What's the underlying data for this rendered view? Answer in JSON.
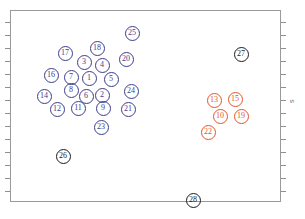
{
  "figure": {
    "axis_label_right": "s",
    "frame": {
      "x": 10,
      "y": 10,
      "width": 271,
      "height": 192
    }
  },
  "chart_data": {
    "type": "scatter",
    "title": "",
    "xlabel": "",
    "ylabel": "s",
    "grid": false,
    "legend": "none",
    "xlim": [
      0,
      271
    ],
    "ylim": [
      0,
      192
    ],
    "axis_ticks": {
      "left_labeled": false,
      "right_labeled": false,
      "bottom_labeled": false,
      "top_labeled": false,
      "left_tick_y": [
        22,
        35,
        48,
        61,
        74,
        87,
        100,
        113,
        126,
        139,
        152,
        165,
        178,
        191
      ],
      "right_tick_y": [
        22,
        35,
        48,
        61,
        74,
        87,
        100,
        113,
        126,
        139,
        152,
        165,
        178,
        191
      ]
    },
    "series": [
      {
        "name": "cluster-blue",
        "color": "#3d3d8c",
        "marker": "numbered-circle",
        "points": [
          {
            "label": "1",
            "x": 79,
            "y": 68
          },
          {
            "label": "2",
            "x": 92,
            "y": 85
          },
          {
            "label": "3",
            "x": 74,
            "y": 52
          },
          {
            "label": "4",
            "x": 92,
            "y": 55
          },
          {
            "label": "5",
            "x": 101,
            "y": 69
          },
          {
            "label": "6",
            "x": 76,
            "y": 86
          },
          {
            "label": "7",
            "x": 61,
            "y": 67
          },
          {
            "label": "8",
            "x": 61,
            "y": 80
          },
          {
            "label": "9",
            "x": 93,
            "y": 98
          },
          {
            "label": "11",
            "x": 68,
            "y": 98
          },
          {
            "label": "12",
            "x": 47,
            "y": 99
          },
          {
            "label": "14",
            "x": 34,
            "y": 86
          },
          {
            "label": "16",
            "x": 41,
            "y": 65
          },
          {
            "label": "17",
            "x": 55,
            "y": 43
          },
          {
            "label": "18",
            "x": 87,
            "y": 38
          },
          {
            "label": "20",
            "x": 116,
            "y": 49
          },
          {
            "label": "21",
            "x": 118,
            "y": 99
          },
          {
            "label": "23",
            "x": 91,
            "y": 117
          },
          {
            "label": "24",
            "x": 121,
            "y": 81
          },
          {
            "label": "25",
            "x": 122,
            "y": 23
          }
        ]
      },
      {
        "name": "cluster-red",
        "color": "#e2552b",
        "marker": "numbered-circle",
        "points": [
          {
            "label": "10",
            "x": 210,
            "y": 106
          },
          {
            "label": "13",
            "x": 204,
            "y": 90
          },
          {
            "label": "15",
            "x": 225,
            "y": 89
          },
          {
            "label": "19",
            "x": 231,
            "y": 106
          },
          {
            "label": "22",
            "x": 198,
            "y": 122
          }
        ]
      },
      {
        "name": "outliers-black",
        "color": "#1b1b1b",
        "marker": "numbered-circle",
        "points": [
          {
            "label": "26",
            "x": 53,
            "y": 146
          },
          {
            "label": "27",
            "x": 231,
            "y": 44
          },
          {
            "label": "28",
            "x": 183,
            "y": 190
          }
        ]
      }
    ]
  }
}
